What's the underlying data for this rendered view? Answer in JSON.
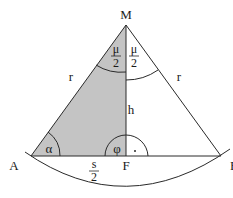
{
  "diagram": {
    "colors": {
      "shade": "#c4c4c4",
      "stroke": "#2a2a2a",
      "background": "#ffffff"
    },
    "points": {
      "M": "M",
      "A": "A",
      "F": "F",
      "B": "B"
    },
    "labels": {
      "radius_left": "r",
      "radius_right": "r",
      "height": "h",
      "half_chord_num": "s",
      "half_chord_den": "2",
      "half_angle_left_num": "μ",
      "half_angle_left_den": "2",
      "half_angle_right_num": "μ",
      "half_angle_right_den": "2",
      "angle_alpha": "α",
      "angle_phi": "φ",
      "right_angle_mark": "·"
    }
  }
}
